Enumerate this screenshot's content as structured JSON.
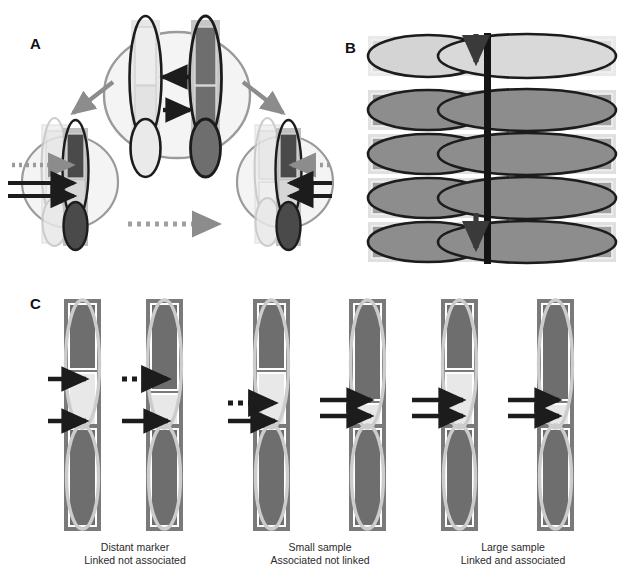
{
  "figure": {
    "type": "scientific-diagram",
    "background": "#ffffff",
    "width": 625,
    "height": 581
  },
  "palette": {
    "dark_segment": "#6e6e6e",
    "darker_segment": "#4a4a4a",
    "light_segment": "#e2e2e2",
    "pale_segment": "#efefef",
    "mid_gray": "#a8a8a8",
    "light_gray_outline": "#c9c9c9",
    "pale_halo": "#f2f2f2",
    "black_stroke": "#1c1c1c",
    "gray_arrow": "#8c8c8c",
    "dark_box": "#7a7a7a",
    "white": "#ffffff"
  },
  "panels": [
    {
      "id": "A",
      "label": "A",
      "label_x": 30,
      "label_y": 36,
      "description": "Family pedigree style: parental chromosome pair at top centre inside a circle, transmission arrows to two offspring circles at lower left and lower right.",
      "elements": {
        "parent_circle": "large pale circle containing two chromosome pairs",
        "transmission_arrows": [
          "black-arrow-left",
          "black-arrow-right"
        ],
        "descent_arrows": [
          "gray-arrow-down-left",
          "gray-arrow-down-right"
        ],
        "sibling_arrow": "gray-dotted-arrow-right",
        "offspring_markers_left": [
          "dotted-gray-arrow",
          "solid-black-arrow",
          "solid-black-arrow"
        ],
        "offspring_markers_right": [
          "dotted-gray-arrow",
          "solid-black-arrow",
          "solid-black-arrow"
        ]
      }
    },
    {
      "id": "B",
      "label": "B",
      "label_x": 345,
      "label_y": 52,
      "description": "Population sample: five stacked horizontal chromosome rows bisected by a vertical black bar; a vertical black arrow marks the shared marker locus descending through the rows.",
      "row_count": 5,
      "rows": [
        {
          "index": 1,
          "left_fill": "light",
          "right_fill": "light"
        },
        {
          "index": 2,
          "left_fill": "dark",
          "right_fill": "dark"
        },
        {
          "index": 3,
          "left_fill": "dark",
          "right_fill": "dark"
        },
        {
          "index": 4,
          "left_fill": "dark",
          "right_fill": "dark"
        },
        {
          "index": 5,
          "left_fill": "dark",
          "right_fill": "dark"
        }
      ],
      "locus_bar": "vertical-black-bar",
      "locus_arrows": [
        "arrow-head-top",
        "arrow-head-bottom"
      ]
    },
    {
      "id": "C",
      "label": "C",
      "label_x": 30,
      "label_y": 303,
      "description": "Three paired-chromosome scenarios, each with two vertical chromosomes and marker arrows, captioned below.",
      "groups": [
        {
          "id": "distant-marker",
          "caption_line1": "Distant marker",
          "caption_line2": "Linked not associated",
          "caption_x": 130,
          "caption_y": 543,
          "chromosomes": [
            {
              "arrows": [
                "solid-arrow-upper",
                "solid-arrow-lower"
              ]
            },
            {
              "arrows": [
                "dotted-arrow-upper",
                "solid-arrow-lower"
              ]
            }
          ]
        },
        {
          "id": "small-sample",
          "caption_line1": "Small sample",
          "caption_line2": "Associated not linked",
          "caption_x": 320,
          "caption_y": 543,
          "chromosomes": [
            {
              "arrows": [
                "dotted-arrow-upper",
                "solid-arrow-lower"
              ]
            },
            {
              "arrows": [
                "solid-arrow-upper",
                "solid-arrow-lower"
              ]
            }
          ]
        },
        {
          "id": "large-sample",
          "caption_line1": "Large sample",
          "caption_line2": "Linked and associated",
          "caption_x": 513,
          "caption_y": 543,
          "chromosomes": [
            {
              "arrows": [
                "solid-arrow-upper",
                "solid-arrow-lower"
              ]
            },
            {
              "arrows": [
                "solid-arrow-upper",
                "solid-arrow-lower"
              ]
            }
          ]
        }
      ]
    }
  ]
}
